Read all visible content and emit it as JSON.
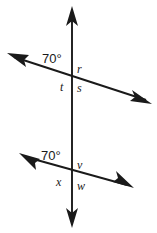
{
  "figure": {
    "background_color": "#ffffff",
    "ink_color": "#1a1a1a",
    "width": 157,
    "height": 233
  },
  "lines": {
    "vertical": {
      "name": "vertical-line",
      "x1": 72,
      "y1": 14,
      "x2": 72,
      "y2": 220,
      "arrow_start": true,
      "arrow_end": true
    },
    "upper_transversal": {
      "name": "upper-transversal-line",
      "x1": 14,
      "y1": 57,
      "x2": 146,
      "y2": 100,
      "arrow_start": true,
      "arrow_end": true
    },
    "lower_transversal": {
      "name": "lower-transversal-line",
      "x1": 26,
      "y1": 157,
      "x2": 127,
      "y2": 185,
      "arrow_start": true,
      "arrow_end": true
    }
  },
  "intersections": {
    "upper": {
      "x": 72,
      "y": 78
    },
    "lower": {
      "x": 72,
      "y": 172
    }
  },
  "labels": {
    "upper_angle": {
      "text": "70°",
      "x": 42,
      "y": 63
    },
    "upper_r": {
      "text": "r",
      "x": 77,
      "y": 73
    },
    "upper_t": {
      "text": "t",
      "x": 60,
      "y": 91
    },
    "upper_s": {
      "text": "s",
      "x": 77,
      "y": 92
    },
    "lower_angle": {
      "text": "70°",
      "x": 41,
      "y": 160
    },
    "lower_v": {
      "text": "v",
      "x": 77,
      "y": 169
    },
    "lower_x": {
      "text": "x",
      "x": 56,
      "y": 186
    },
    "lower_w": {
      "text": "w",
      "x": 77,
      "y": 190
    }
  }
}
